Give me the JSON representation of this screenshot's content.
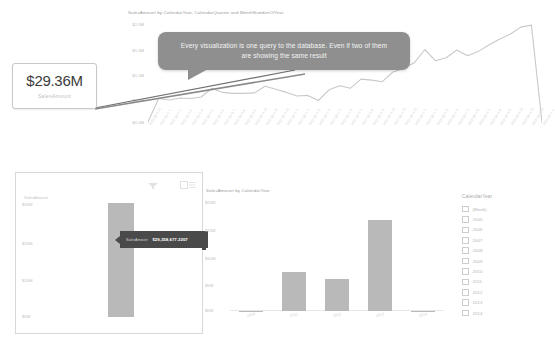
{
  "callout": {
    "text": "Every visualization is one query to the database. Even if two of them are showing the same result"
  },
  "kpi_card": {
    "value": "$29.36M",
    "label": "SalesAmount"
  },
  "card_visual": {
    "y_axis_title": "SalesAmount",
    "header_icons": [
      "filter-icon",
      "focus-mode-icon"
    ],
    "y_ticks": [
      "$30M",
      "$20M",
      "$10M",
      "$0M"
    ],
    "tooltip": {
      "key": "SalesAmount",
      "value": "$29,358,677.2207"
    },
    "bar_value": 29.36
  },
  "line_chart": {
    "title": "SalesAmount by CalendarYear, CalendarQuarter and MonthNumberOfYear"
  },
  "bar_chart": {
    "title": "SalesAmount by CalendarYear"
  },
  "slicer": {
    "title": "CalendarYear",
    "items": [
      {
        "label": "(Blank)",
        "checked": false
      },
      {
        "label": "2005",
        "checked": false
      },
      {
        "label": "2006",
        "checked": false
      },
      {
        "label": "2007",
        "checked": false
      },
      {
        "label": "2008",
        "checked": false
      },
      {
        "label": "2009",
        "checked": false
      },
      {
        "label": "2010",
        "checked": false
      },
      {
        "label": "2011",
        "checked": false
      },
      {
        "label": "2012",
        "checked": false
      },
      {
        "label": "2013",
        "checked": false
      },
      {
        "label": "2014",
        "checked": false
      }
    ]
  },
  "chart_data": [
    {
      "type": "line",
      "title": "SalesAmount by CalendarYear, CalendarQuarter and MonthNumberOfYear",
      "xlabel": "",
      "ylabel": "SalesAmount",
      "ylim": [
        0,
        2000000
      ],
      "y_ticks": [
        "$0.0M",
        "$0.5M",
        "$1.0M",
        "$1.5M",
        "$2.0M"
      ],
      "grid": false,
      "legend": "none",
      "x": [
        "2010 Qtr 4 12",
        "2011 Qtr 1 1",
        "2011 Qtr 1 2",
        "2011 Qtr 1 3",
        "2011 Qtr 2 4",
        "2011 Qtr 2 5",
        "2011 Qtr 2 6",
        "2011 Qtr 3 7",
        "2011 Qtr 3 8",
        "2011 Qtr 3 9",
        "2011 Qtr 4 10",
        "2011 Qtr 4 11",
        "2011 Qtr 4 12",
        "2012 Qtr 1 1",
        "2012 Qtr 1 2",
        "2012 Qtr 1 3",
        "2012 Qtr 2 4",
        "2012 Qtr 2 5",
        "2012 Qtr 2 6",
        "2012 Qtr 3 7",
        "2012 Qtr 3 8",
        "2012 Qtr 3 9",
        "2012 Qtr 4 10",
        "2012 Qtr 4 11",
        "2012 Qtr 4 12",
        "2013 Qtr 1 1",
        "2013 Qtr 1 2",
        "2013 Qtr 1 3",
        "2013 Qtr 2 4",
        "2013 Qtr 2 5",
        "2013 Qtr 2 6",
        "2013 Qtr 3 7",
        "2013 Qtr 3 8",
        "2013 Qtr 3 9",
        "2013 Qtr 4 10",
        "2013 Qtr 4 11",
        "2013 Qtr 4 12",
        "2014 Qtr 1 1"
      ],
      "values": [
        0.04,
        0.5,
        0.47,
        0.51,
        0.5,
        0.53,
        0.7,
        0.62,
        0.6,
        0.6,
        0.61,
        0.74,
        0.68,
        0.62,
        0.55,
        0.56,
        0.46,
        0.67,
        0.75,
        0.7,
        0.88,
        0.86,
        0.83,
        1.02,
        1.09,
        1.2,
        1.46,
        1.24,
        1.3,
        1.45,
        1.34,
        1.42,
        1.55,
        1.66,
        1.76,
        1.9,
        1.94,
        0.03
      ],
      "value_units": "millions"
    },
    {
      "type": "bar",
      "title": "SalesAmount by CalendarYear",
      "categories": [
        "2010",
        "2011",
        "2012",
        "2013",
        "2014"
      ],
      "values": [
        0.04,
        7.08,
        5.84,
        16.35,
        0.03
      ],
      "xlabel": "",
      "ylabel": "SalesAmount",
      "ylim": [
        0,
        20
      ],
      "y_ticks": [
        "$0M",
        "$5M",
        "$10M",
        "$15M",
        "$20M"
      ],
      "value_units": "millions",
      "grid": false,
      "legend": "none"
    },
    {
      "type": "bar",
      "title": "SalesAmount",
      "categories": [
        "Total"
      ],
      "values": [
        29.36
      ],
      "ylim": [
        0,
        30
      ],
      "y_ticks": [
        "$0M",
        "$10M",
        "$20M",
        "$30M"
      ],
      "value_units": "millions",
      "grid": false,
      "legend": "none"
    }
  ]
}
